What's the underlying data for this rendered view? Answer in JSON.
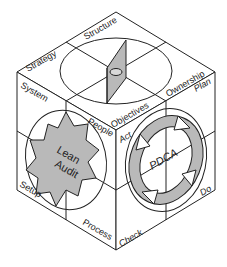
{
  "diagram": {
    "type": "isometric-cube",
    "colors": {
      "line": "#222222",
      "fill_gray": "#b9b9b9",
      "background": "#ffffff"
    },
    "top_face": {
      "symbol": "compass-needle",
      "labels": {
        "top": "Structure",
        "left": "Strategy",
        "right": "Ownership",
        "bottom": "Objectives"
      }
    },
    "left_face": {
      "center_text_line1": "Lean",
      "center_text_line2": "Audit",
      "symbol": "gear",
      "labels": {
        "top_left": "System",
        "top_right": "People",
        "bottom_left": "Setup",
        "bottom_right": "Process"
      }
    },
    "right_face": {
      "center_text": "PDCA",
      "symbol": "cycle-arrows",
      "labels": {
        "top_left": "Act",
        "top_right": "Plan",
        "bottom_left": "Check",
        "bottom_right": "Do"
      }
    }
  }
}
